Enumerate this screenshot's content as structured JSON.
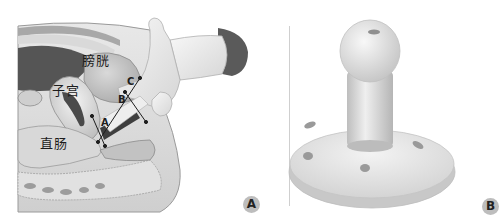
{
  "figure": {
    "caption_partial": "",
    "panels": [
      {
        "id": "A",
        "badge": "A",
        "description": "sagittal pelvic section with examiner's gloved hand, measurement lines",
        "organ_labels": {
          "uterus": "子宫",
          "bladder": "膀胱",
          "rectum": "直肠"
        },
        "measure_points": [
          "A",
          "B",
          "C"
        ]
      },
      {
        "id": "B",
        "badge": "B",
        "description": "pessary (ball-handled disc with holes)"
      }
    ],
    "colors": {
      "background": "#ffffff",
      "tissue_light": "#e4e4e4",
      "tissue_mid": "#b8b8b8",
      "tissue_dark": "#4a4a4a",
      "glove": "#ececec",
      "cuff": "#5a5a5a",
      "badge": "#bdbdbd",
      "divider": "#cfcfcf"
    }
  }
}
